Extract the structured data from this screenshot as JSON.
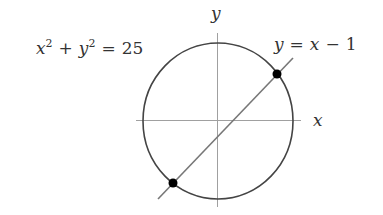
{
  "diagram": {
    "type": "circle-line-intersection",
    "axes": {
      "x_label": "x",
      "y_label": "y"
    },
    "circle": {
      "equation_lhs_x": "x",
      "equation_lhs_y": "y",
      "exponent": "2",
      "plus": "+",
      "equals": "=",
      "rhs": "25",
      "label": "x² + y² = 25",
      "color": "#444444"
    },
    "line": {
      "lhs": "y",
      "equals": "=",
      "rhs_var": "x",
      "minus": "−",
      "rhs_const": "1",
      "label": "y = x − 1",
      "color": "#777777"
    },
    "intersection_points": [
      {
        "name": "upper-intersection",
        "x": 4,
        "y": 3
      },
      {
        "name": "lower-intersection",
        "x": -3,
        "y": -4
      }
    ],
    "colors": {
      "axis": "#999999",
      "point": "#000000",
      "text": "#333333"
    }
  }
}
